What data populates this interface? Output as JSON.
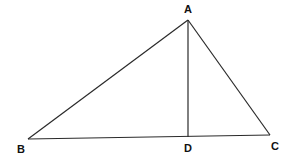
{
  "diagram": {
    "type": "geometry",
    "points": {
      "A": {
        "label": "A",
        "x": 188,
        "y": 20
      },
      "B": {
        "label": "B",
        "x": 28,
        "y": 139
      },
      "C": {
        "label": "C",
        "x": 270,
        "y": 135
      },
      "D": {
        "label": "D",
        "x": 188,
        "y": 137
      }
    },
    "segments": [
      {
        "from": "A",
        "to": "B"
      },
      {
        "from": "A",
        "to": "C"
      },
      {
        "from": "B",
        "to": "C"
      },
      {
        "from": "A",
        "to": "D"
      }
    ],
    "labels": {
      "A": "A",
      "B": "B",
      "C": "C",
      "D": "D"
    },
    "colors": {
      "line": "#2a2a2a",
      "text": "#111111",
      "background": "#ffffff"
    }
  }
}
